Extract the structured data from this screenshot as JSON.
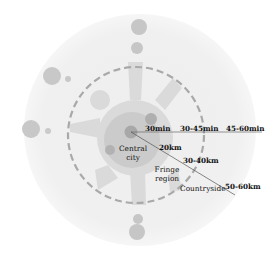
{
  "diagram": {
    "type": "concentric-urban-region",
    "center": {
      "x": 130,
      "y": 130
    },
    "colors": {
      "outer_ring": "#f1f1f1",
      "dashed_ring": "#a8a8a8",
      "fringe_fill": "#dcdcdc",
      "central_fill": "#cdcdcd",
      "node_dark": "#aeaeae",
      "node_light": "#c4c4c4",
      "axis_line": "#555555"
    },
    "zones": [
      {
        "id": "central-city",
        "label": "Central city"
      },
      {
        "id": "fringe-region",
        "label": "Fringe region"
      },
      {
        "id": "countryside",
        "label": "Countryside"
      }
    ],
    "time_labels": [
      {
        "id": "t1",
        "label": "30min"
      },
      {
        "id": "t2",
        "label": "30-45min"
      },
      {
        "id": "t3",
        "label": "45-60min"
      }
    ],
    "distance_labels": [
      {
        "id": "d1",
        "label": "20km"
      },
      {
        "id": "d2",
        "label": "30-40km"
      },
      {
        "id": "d3",
        "label": "50-60km"
      }
    ]
  }
}
